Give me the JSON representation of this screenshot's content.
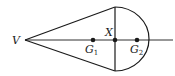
{
  "diagram": {
    "type": "cone-hemisphere composite solid cross-section",
    "colors": {
      "stroke": "#1a1a1a",
      "background": "#ffffff"
    },
    "labels": {
      "apex": "V",
      "junction": "X",
      "g1_main": "G",
      "g1_sub": "1",
      "g2_main": "G",
      "g2_sub": "2"
    },
    "points": [
      {
        "name": "V",
        "x": 25,
        "y": 40
      },
      {
        "name": "G1",
        "x": 93,
        "y": 40
      },
      {
        "name": "X",
        "x": 115,
        "y": 40
      },
      {
        "name": "G2",
        "x": 137,
        "y": 40
      }
    ]
  }
}
